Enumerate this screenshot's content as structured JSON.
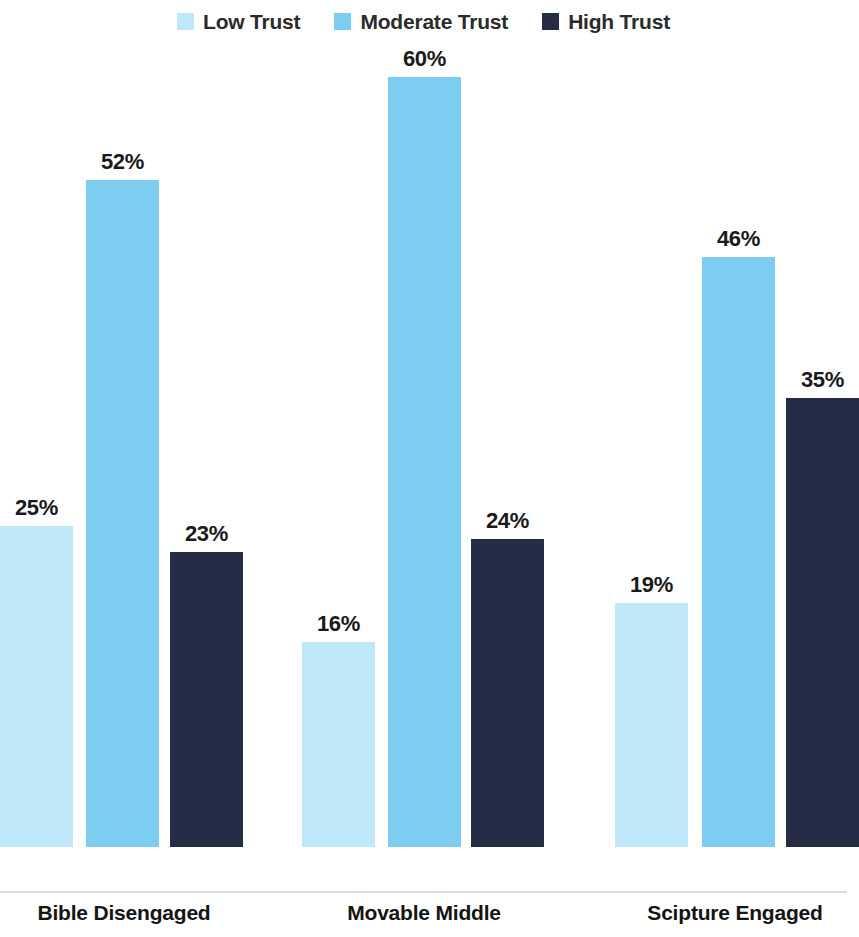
{
  "legend": {
    "items": [
      {
        "label": "Low Trust",
        "color": "#bfe9f9",
        "icon": "legend-swatch-low-trust"
      },
      {
        "label": "Moderate Trust",
        "color": "#7ccdf0",
        "icon": "legend-swatch-moderate-trust"
      },
      {
        "label": "High Trust",
        "color": "#252c46",
        "icon": "legend-swatch-high-trust"
      }
    ]
  },
  "chart_data": {
    "type": "bar",
    "title": "",
    "subtitle": "",
    "xlabel": "",
    "ylabel": "",
    "ylim": [
      0,
      65
    ],
    "grid": false,
    "legend_position": "top-center",
    "value_suffix": "%",
    "categories": [
      "Bible Disengaged",
      "Movable Middle",
      "Scipture Engaged"
    ],
    "series": [
      {
        "name": "Low Trust",
        "color": "#bfe9f9",
        "values": [
          25,
          16,
          19
        ],
        "labels": [
          "25%",
          "16%",
          "19%"
        ]
      },
      {
        "name": "Moderate Trust",
        "color": "#7ccdf0",
        "values": [
          52,
          60,
          46
        ],
        "labels": [
          "52%",
          "60%",
          "46%"
        ]
      },
      {
        "name": "High Trust",
        "color": "#252c46",
        "values": [
          23,
          24,
          35
        ],
        "labels": [
          "23%",
          "24%",
          "35%"
        ]
      }
    ]
  },
  "bars": [
    {
      "name": "bar-bible-disengaged-low-trust",
      "label": "25%",
      "value": 25,
      "color": "#bfe9f9",
      "left": 0,
      "width": 73
    },
    {
      "name": "bar-bible-disengaged-moderate-trust",
      "label": "52%",
      "value": 52,
      "color": "#7ccdf0",
      "left": 86,
      "width": 73
    },
    {
      "name": "bar-bible-disengaged-high-trust",
      "label": "23%",
      "value": 23,
      "color": "#252c46",
      "left": 170,
      "width": 73
    },
    {
      "name": "bar-movable-middle-low-trust",
      "label": "16%",
      "value": 16,
      "color": "#bfe9f9",
      "left": 302,
      "width": 73
    },
    {
      "name": "bar-movable-middle-moderate-trust",
      "label": "60%",
      "value": 60,
      "color": "#7ccdf0",
      "left": 388,
      "width": 73
    },
    {
      "name": "bar-movable-middle-high-trust",
      "label": "24%",
      "value": 24,
      "color": "#252c46",
      "left": 471,
      "width": 73
    },
    {
      "name": "bar-scipture-engaged-low-trust",
      "label": "19%",
      "value": 19,
      "color": "#bfe9f9",
      "left": 615,
      "width": 73
    },
    {
      "name": "bar-scipture-engaged-moderate-trust",
      "label": "46%",
      "value": 46,
      "color": "#7ccdf0",
      "left": 702,
      "width": 73
    },
    {
      "name": "bar-scipture-engaged-high-trust",
      "label": "35%",
      "value": 35,
      "color": "#252c46",
      "left": 786,
      "width": 73
    }
  ],
  "category_labels": [
    {
      "name": "category-label-bible-disengaged",
      "text": "Bible Disengaged",
      "center": 124
    },
    {
      "name": "category-label-movable-middle",
      "text": "Movable Middle",
      "center": 424
    },
    {
      "name": "category-label-scipture-engaged",
      "text": "Scipture Engaged",
      "center": 735
    }
  ],
  "scale": {
    "px_per_percent": 12.83,
    "baseline_y": 892
  }
}
